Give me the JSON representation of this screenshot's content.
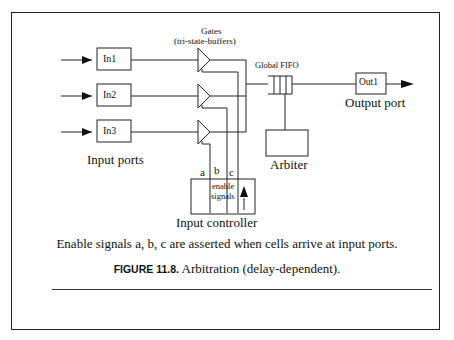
{
  "figure": {
    "gates_label": "Gates",
    "gates_sublabel": "(tri-state-buffers)",
    "input_ports": [
      "In1",
      "In2",
      "In3"
    ],
    "input_ports_label": "Input ports",
    "fifo_label": "Global FIFO",
    "output_port": "Out1",
    "output_port_label": "Output port",
    "arbiter_label": "Arbiter",
    "signal_labels": [
      "a",
      "b",
      "c"
    ],
    "enable_label_line1": "enable",
    "enable_label_line2": "signals",
    "input_controller_label": "Input controller",
    "description": "Enable signals a, b, c are asserted when cells arrive at input ports.",
    "caption_number": "FIGURE 11.8.",
    "caption_text": "Arbitration (delay-dependent)."
  }
}
